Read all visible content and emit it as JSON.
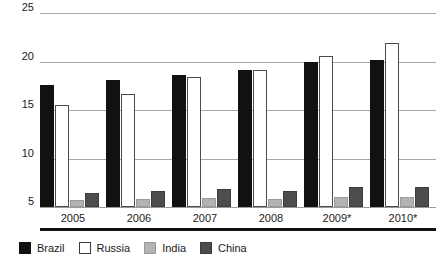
{
  "chart_data": {
    "type": "bar",
    "title": "",
    "subtitle": "",
    "xlabel": "",
    "ylabel": "",
    "categories": [
      "2005",
      "2006",
      "2007",
      "2008",
      "2009*",
      "2010*"
    ],
    "series": [
      {
        "name": "Brazil",
        "color": "#111111",
        "values": [
          17.6,
          18.1,
          18.6,
          19.1,
          19.9,
          20.2
        ]
      },
      {
        "name": "Russia",
        "color": "#ffffff",
        "values": [
          15.5,
          16.7,
          18.4,
          19.1,
          20.6,
          21.9
        ]
      },
      {
        "name": "India",
        "color": "#b3b3b3",
        "values": [
          5.7,
          5.8,
          5.9,
          5.8,
          6.0,
          6.0
        ]
      },
      {
        "name": "China",
        "color": "#4d4d4d",
        "values": [
          6.4,
          6.7,
          6.9,
          6.7,
          7.1,
          7.1
        ]
      }
    ],
    "ylim": [
      5,
      25
    ],
    "yticks": [
      5,
      10,
      15,
      20,
      25
    ],
    "ytick_labels": [
      "5",
      "10",
      "15",
      "20",
      "25"
    ],
    "grid": true,
    "legend_position": "bottom-left"
  },
  "axis": {
    "y_labels": [
      "25",
      "20",
      "15",
      "10",
      "5"
    ],
    "x_labels": [
      "2005",
      "2006",
      "2007",
      "2008",
      "2009*",
      "2010*"
    ]
  },
  "legend": {
    "items": [
      {
        "label": "Brazil",
        "swatch": "brazil"
      },
      {
        "label": "Russia",
        "swatch": "russia"
      },
      {
        "label": "India",
        "swatch": "india"
      },
      {
        "label": "China",
        "swatch": "china"
      }
    ]
  }
}
